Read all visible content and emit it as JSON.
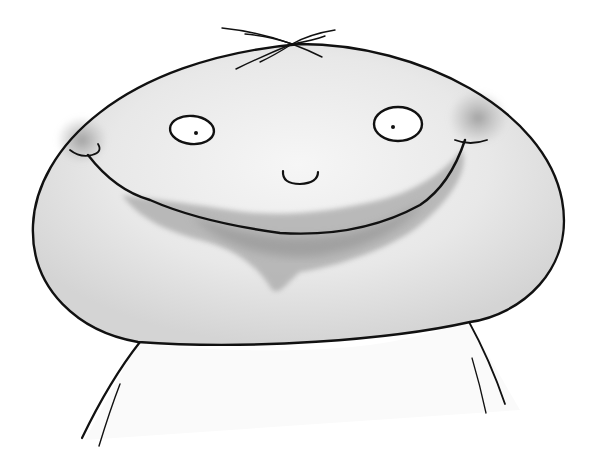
{
  "illustration": {
    "subject": "smiling round-headed character",
    "style": "ink and grey watercolor",
    "colors": {
      "background": "#ffffff",
      "ink": "#111111",
      "head_fill": "#e9e9e9",
      "wash_dark": "#9c9c9c",
      "wash_mid": "#bdbdbd",
      "cheek": "#a6a6a6",
      "eye_white": "#ffffff"
    },
    "elements": [
      "hair",
      "head",
      "left-eye",
      "right-eye",
      "nose",
      "smile",
      "left-cheek",
      "right-cheek",
      "beard-wash",
      "body"
    ]
  }
}
